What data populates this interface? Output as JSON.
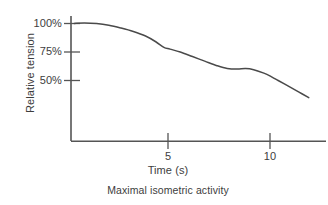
{
  "chart_data": {
    "type": "line",
    "title": "",
    "caption": "Maximal isometric activity",
    "xlabel": "Time (s)",
    "ylabel": "Relative tension",
    "xlim": [
      0,
      12.3
    ],
    "ylim": [
      20,
      108
    ],
    "grid": false,
    "legend": null,
    "xticks": [
      {
        "value": 5,
        "label": "5"
      },
      {
        "value": 10,
        "label": "10"
      }
    ],
    "yticks": [
      {
        "value": 100,
        "label": "100%"
      },
      {
        "value": 75,
        "label": "75%"
      },
      {
        "value": 50,
        "label": "50%"
      }
    ],
    "series": [
      {
        "name": "Relative tension",
        "color": "#4a4a4a",
        "x": [
          0.4,
          0.9,
          1.5,
          2.1,
          2.7,
          3.3,
          3.9,
          4.4,
          4.8,
          5.1,
          5.6,
          6.2,
          6.8,
          7.4,
          7.9,
          8.4,
          8.8,
          9.2,
          9.7,
          10.1,
          10.4,
          10.9,
          11.4,
          11.9
        ],
        "values": [
          100,
          100.5,
          100,
          98.5,
          96,
          93,
          89,
          84,
          79,
          77.5,
          75,
          71,
          67,
          63,
          60.5,
          60,
          60.5,
          59.5,
          56.5,
          53,
          50,
          45,
          40,
          35
        ]
      }
    ]
  },
  "axis": {
    "line_color": "#555555",
    "tick_color": "#555555"
  }
}
